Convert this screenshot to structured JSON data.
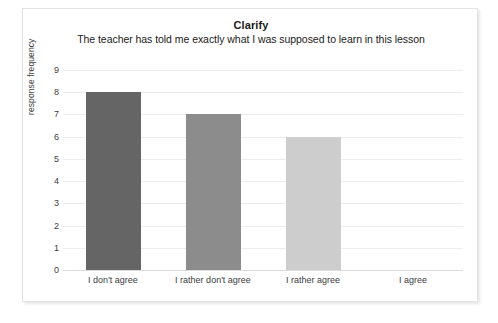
{
  "chart_data": {
    "type": "bar",
    "title": "Clarify",
    "subtitle": "The teacher has told me exactly what I was supposed to learn in this lesson",
    "xlabel": "",
    "ylabel": "response frequency",
    "categories": [
      "I don't agree",
      "I rather don't agree",
      "I rather agree",
      "I agree"
    ],
    "values": [
      8,
      7,
      6,
      0
    ],
    "bar_colors": [
      "#656565",
      "#8c8c8c",
      "#cdcdcd",
      "#e8e8e8"
    ],
    "ylim": [
      0,
      9
    ],
    "ytick_labels": [
      "0",
      "1",
      "2",
      "3",
      "4",
      "5",
      "6",
      "7",
      "8",
      "9"
    ],
    "ytick_values": [
      0,
      1,
      2,
      3,
      4,
      5,
      6,
      7,
      8,
      9
    ],
    "grid": true,
    "legend": false,
    "legend_position": "none",
    "frame_border_color": "#e2e2e2",
    "gridline_color": "#ececed"
  }
}
